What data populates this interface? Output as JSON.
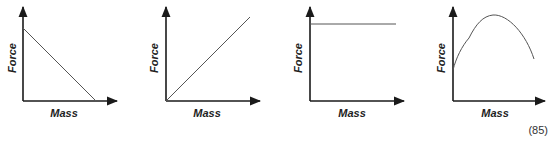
{
  "figure_number": "(85)",
  "colors": {
    "axis": "#1a1a1a",
    "line": "#555555"
  },
  "graphs": [
    {
      "id": "A",
      "x_label": "Mass",
      "y_label": "Force",
      "shape": "decreasing-linear"
    },
    {
      "id": "B",
      "x_label": "Mass",
      "y_label": "Force",
      "shape": "increasing-linear-through-origin"
    },
    {
      "id": "C",
      "x_label": "Mass",
      "y_label": "Force",
      "shape": "constant-horizontal"
    },
    {
      "id": "D",
      "x_label": "Mass",
      "y_label": "Force",
      "shape": "rise-to-peak-then-fall"
    }
  ]
}
